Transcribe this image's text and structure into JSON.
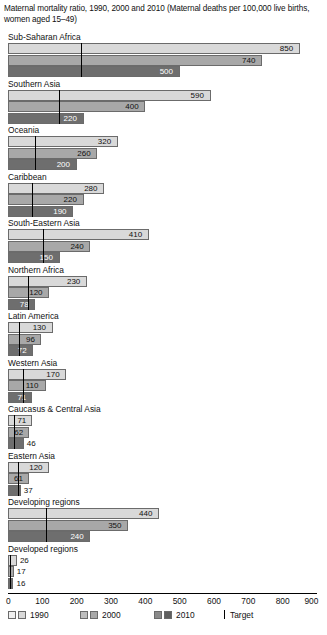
{
  "chart_data": {
    "type": "bar",
    "orientation": "horizontal",
    "title": "Maternal mortality ratio, 1990, 2000 and 2010 (Maternal deaths per 100,000 live births, women aged 15–49)",
    "xlabel": "",
    "ylabel": "",
    "xlim": [
      0,
      900
    ],
    "xticks": [
      0,
      100,
      200,
      300,
      400,
      500,
      600,
      700,
      800,
      900
    ],
    "grid": false,
    "legend_position": "bottom",
    "legend": [
      "1990",
      "2000",
      "2010",
      "Target"
    ],
    "series_names": [
      "1990",
      "2000",
      "2010"
    ],
    "categories": [
      "Sub-Saharan Africa",
      "Southern Asia",
      "Oceania",
      "Caribbean",
      "South-Eastern Asia",
      "Northern Africa",
      "Latin America",
      "Western Asia",
      "Caucasus & Central Asia",
      "Eastern Asia",
      "Developing regions",
      "Developed regions"
    ],
    "series": [
      {
        "name": "1990",
        "values": [
          850,
          590,
          320,
          280,
          410,
          230,
          130,
          170,
          71,
          120,
          440,
          26
        ]
      },
      {
        "name": "2000",
        "values": [
          740,
          400,
          260,
          220,
          240,
          120,
          96,
          110,
          62,
          61,
          350,
          17
        ]
      },
      {
        "name": "2010",
        "values": [
          500,
          220,
          200,
          190,
          150,
          78,
          72,
          71,
          46,
          37,
          240,
          16
        ]
      }
    ],
    "target_values": [
      212.5,
      147.5,
      80,
      70,
      102.5,
      57.5,
      32.5,
      42.5,
      17.75,
      30,
      110,
      6.5
    ],
    "target_note": "Target marker = 75% reduction from 1990 level"
  },
  "legend_items": [
    {
      "label": "1990",
      "color_light": "#f0f0f0",
      "color_dark": "#d9d9d9"
    },
    {
      "label": "2000",
      "color_light": "#bdbdbd",
      "color_dark": "#a8a8a8"
    },
    {
      "label": "2010",
      "color_light": "#8a8a8a",
      "color_dark": "#5f5f5f"
    }
  ],
  "target_label": "Target",
  "colors": {
    "series_1990": "#d9d9d9",
    "series_2000": "#a8a8a8",
    "series_2010": "#6e6e6e",
    "bar_border": "#6b6b6b",
    "axis": "#000000",
    "target_line": "#000000",
    "text": "#111111",
    "background": "#ffffff"
  }
}
